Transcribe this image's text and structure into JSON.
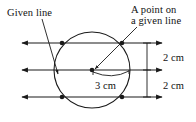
{
  "figure": {
    "background_color": "#ffffff",
    "stroke_color": "#1a1a1a",
    "labels": {
      "given_line": "Given line",
      "point_on_line_1": "A point on",
      "point_on_line_2": "a given line",
      "radius": "3 cm",
      "gap_top": "2 cm",
      "gap_bottom": "2 cm"
    },
    "geometry": {
      "circle": {
        "cx": 92,
        "cy": 70,
        "r": 38
      },
      "lines": [
        {
          "name": "top-given-line",
          "y": 43,
          "x1": 20,
          "x2": 164
        },
        {
          "name": "middle-given-line",
          "y": 70,
          "x1": 20,
          "x2": 164
        },
        {
          "name": "bottom-given-line",
          "y": 97,
          "x1": 20,
          "x2": 164
        }
      ],
      "intersection_points": [
        {
          "x": 62,
          "y": 43
        },
        {
          "x": 122,
          "y": 43
        },
        {
          "x": 92,
          "y": 70
        },
        {
          "x": 62,
          "y": 97
        },
        {
          "x": 122,
          "y": 97
        }
      ],
      "dimension_line": {
        "x": 147,
        "y1": 43,
        "y2": 97
      },
      "radius_arc": {
        "from_x": 92,
        "from_y": 70,
        "to_x": 130,
        "to_y": 70
      }
    }
  }
}
